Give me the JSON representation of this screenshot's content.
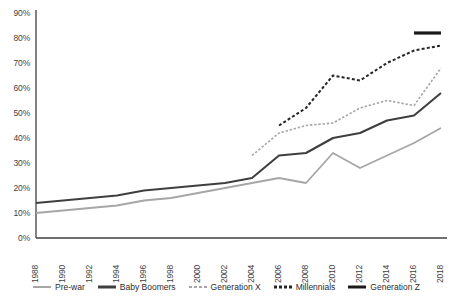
{
  "chart_data": {
    "type": "line",
    "title": "",
    "subtitle": "",
    "xlabel": "",
    "ylabel": "",
    "xlim": [
      1988,
      2018
    ],
    "ylim": [
      0,
      0.9
    ],
    "grid": false,
    "legend_position": "bottom",
    "x": [
      1988,
      1990,
      1992,
      1994,
      1996,
      1998,
      2000,
      2002,
      2004,
      2006,
      2008,
      2010,
      2012,
      2014,
      2016,
      2018
    ],
    "xtick_labels": [
      "1988",
      "1990",
      "1992",
      "1994",
      "1996",
      "1998",
      "2000",
      "2002",
      "2004",
      "2006",
      "2008",
      "2010",
      "2012",
      "2014",
      "2016",
      "2018"
    ],
    "ytick_labels": [
      "0%",
      "10%",
      "20%",
      "30%",
      "40%",
      "50%",
      "60%",
      "70%",
      "80%",
      "90%"
    ],
    "ytick_values": [
      0,
      10,
      20,
      30,
      40,
      50,
      60,
      70,
      80,
      90
    ],
    "series": [
      {
        "name": "Pre-war",
        "color": "#a6a6a6",
        "style": "solid",
        "width": 1.8,
        "x": [
          1988,
          1990,
          1992,
          1994,
          1996,
          1998,
          2000,
          2002,
          2004,
          2006,
          2008,
          2010,
          2012,
          2014,
          2016,
          2018
        ],
        "values": [
          10,
          11,
          12,
          13,
          15,
          16,
          18,
          20,
          22,
          24,
          22,
          34,
          28,
          33,
          38,
          44
        ]
      },
      {
        "name": "Baby Boomers",
        "color": "#3f3f3f",
        "style": "solid",
        "width": 2.1,
        "x": [
          1988,
          1990,
          1992,
          1994,
          1996,
          1998,
          2000,
          2002,
          2004,
          2006,
          2008,
          2010,
          2012,
          2014,
          2016,
          2018
        ],
        "values": [
          14,
          15,
          16,
          17,
          19,
          20,
          21,
          22,
          24,
          33,
          34,
          40,
          42,
          47,
          49,
          58
        ]
      },
      {
        "name": "Generation X",
        "color": "#a6a6a6",
        "style": "dashed",
        "width": 1.6,
        "x": [
          2004,
          2006,
          2008,
          2010,
          2012,
          2014,
          2016,
          2018
        ],
        "values": [
          33,
          42,
          45,
          46,
          52,
          55,
          53,
          68
        ]
      },
      {
        "name": "Millennials",
        "color": "#262626",
        "style": "dashed",
        "width": 2.0,
        "x": [
          2006,
          2008,
          2010,
          2012,
          2014,
          2016,
          2018
        ],
        "values": [
          45,
          52,
          65,
          63,
          70,
          75,
          77
        ]
      },
      {
        "name": "Generation Z",
        "color": "#1a1a1a",
        "style": "solid",
        "width": 3.2,
        "x": [
          2016,
          2018
        ],
        "values": [
          82,
          82
        ]
      }
    ]
  },
  "legend": {
    "items": [
      {
        "label": "Pre-war",
        "color": "#a6a6a6",
        "style": "solid",
        "width": 2
      },
      {
        "label": "Baby Boomers",
        "color": "#3f3f3f",
        "style": "solid",
        "width": 3
      },
      {
        "label": "Generation X",
        "color": "#a6a6a6",
        "style": "dashed",
        "width": 2
      },
      {
        "label": "Millennials",
        "color": "#262626",
        "style": "dashed",
        "width": 3
      },
      {
        "label": "Generation Z",
        "color": "#1a1a1a",
        "style": "solid",
        "width": 3
      }
    ]
  },
  "axes": {
    "axis_color": "#404040"
  }
}
